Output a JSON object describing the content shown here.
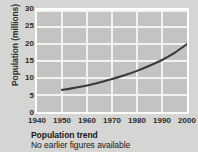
{
  "chart_data": {
    "type": "line",
    "title": "Population trend",
    "subtitle": "No earlier figures available",
    "xlabel": "",
    "ylabel": "Population (millions)",
    "xlim": [
      1940,
      2000
    ],
    "ylim": [
      0,
      30
    ],
    "xticks": [
      1940,
      1950,
      1960,
      1970,
      1980,
      1990,
      2000
    ],
    "yticks": [
      0,
      5,
      10,
      15,
      20,
      25,
      30
    ],
    "grid": true,
    "legend": "none",
    "series": [
      {
        "name": "Population",
        "x": [
          1950,
          1955,
          1960,
          1965,
          1970,
          1975,
          1980,
          1985,
          1990,
          1995,
          2000
        ],
        "values": [
          6.5,
          7.1,
          7.8,
          8.7,
          9.7,
          10.8,
          12.1,
          13.6,
          15.3,
          17.4,
          20.0
        ]
      }
    ],
    "colors": {
      "line": "#3a3a3a",
      "plot_background": "#c3c3c1",
      "gridline": "#f2f2f0",
      "frame": "#ffffff",
      "page_background": "#d5d5d3",
      "text": "#2b2b2b"
    }
  },
  "axes": {
    "y_title": "Population (millions)",
    "y_tick_labels": [
      "30",
      "25",
      "20",
      "15",
      "10",
      "5",
      "0"
    ],
    "x_tick_labels": [
      "1940",
      "1950",
      "1960",
      "1970",
      "1980",
      "1990",
      "2000"
    ]
  },
  "caption": {
    "title": "Population trend",
    "note": "No earlier figures available"
  }
}
